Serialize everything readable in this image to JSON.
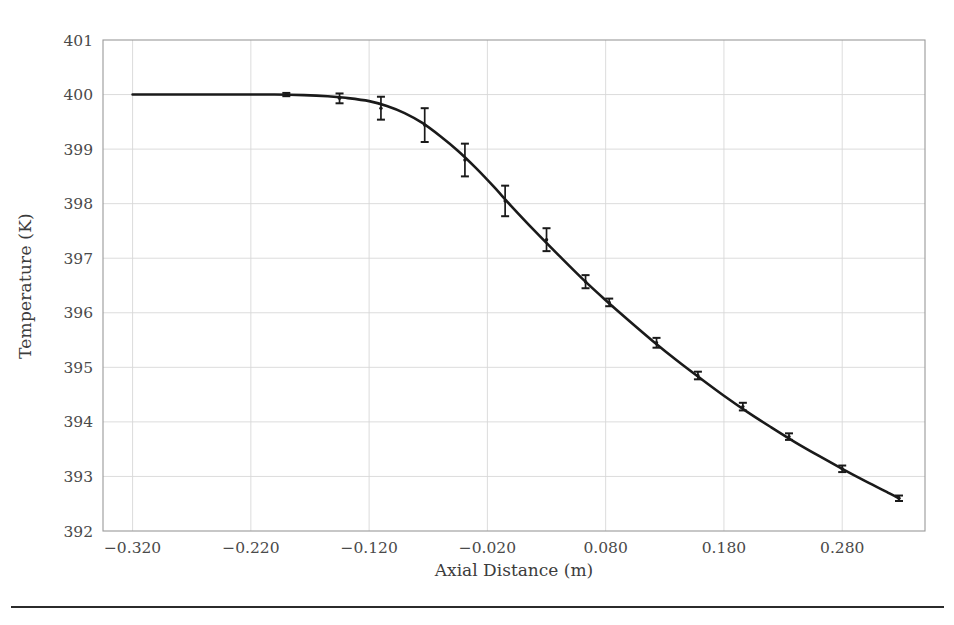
{
  "figure": {
    "background_color": "#ffffff",
    "has_bottom_rule": true
  },
  "axes": {
    "xlabel": "Axial Distance (m)",
    "ylabel": "Temperature (K)",
    "x_ticks": [
      "-0.320",
      "-0.220",
      "-0.120",
      "-0.020",
      "0.080",
      "0.180",
      "0.280"
    ],
    "y_ticks": [
      "392",
      "393",
      "394",
      "395",
      "396",
      "397",
      "398",
      "399",
      "400",
      "401"
    ],
    "grid_color": "#d8d8d8",
    "frame_color": "#9a9a9a",
    "series_color": "#1a1a1a"
  },
  "chart_data": {
    "type": "line",
    "title": "",
    "xlabel": "Axial Distance (m)",
    "ylabel": "Temperature (K)",
    "xlim": [
      -0.345,
      0.35
    ],
    "ylim": [
      392,
      401
    ],
    "xtick_values": [
      -0.32,
      -0.22,
      -0.12,
      -0.02,
      0.08,
      0.18,
      0.28
    ],
    "ytick_values": [
      392,
      393,
      394,
      395,
      396,
      397,
      398,
      399,
      400,
      401
    ],
    "grid": true,
    "legend": "none",
    "series": [
      {
        "name": "Temperature",
        "marker": "point",
        "errorbars": true,
        "x": [
          -0.32,
          -0.25,
          -0.19,
          -0.145,
          -0.12,
          -0.085,
          -0.055,
          -0.028,
          -0.002,
          0.03,
          0.06,
          0.09,
          0.125,
          0.155,
          0.19,
          0.22,
          0.25,
          0.285,
          0.32
        ],
        "y": [
          400.0,
          400.0,
          400.0,
          399.99,
          399.93,
          399.61,
          399.1,
          398.47,
          397.74,
          396.98,
          396.27,
          395.55,
          394.88,
          394.26,
          393.68,
          393.13,
          392.6,
          392.6,
          392.6
        ],
        "yerr": [
          0.02,
          0.03,
          0.04,
          0.05,
          0.09,
          0.19,
          0.3,
          0.28,
          0.2,
          0.12,
          0.08,
          0.06,
          0.05,
          0.05,
          0.04,
          0.04,
          0.04,
          0.04,
          0.04
        ]
      }
    ],
    "curve_points": [
      {
        "x": -0.32,
        "y": 400.0
      },
      {
        "x": -0.28,
        "y": 400.0
      },
      {
        "x": -0.24,
        "y": 400.0
      },
      {
        "x": -0.2,
        "y": 400.0
      },
      {
        "x": -0.175,
        "y": 399.99
      },
      {
        "x": -0.155,
        "y": 399.97
      },
      {
        "x": -0.14,
        "y": 399.94
      },
      {
        "x": -0.12,
        "y": 399.88
      },
      {
        "x": -0.105,
        "y": 399.79
      },
      {
        "x": -0.09,
        "y": 399.66
      },
      {
        "x": -0.075,
        "y": 399.48
      },
      {
        "x": -0.06,
        "y": 399.24
      },
      {
        "x": -0.045,
        "y": 398.97
      },
      {
        "x": -0.03,
        "y": 398.66
      },
      {
        "x": -0.015,
        "y": 398.32
      },
      {
        "x": 0.0,
        "y": 397.96
      },
      {
        "x": 0.02,
        "y": 397.5
      },
      {
        "x": 0.04,
        "y": 397.06
      },
      {
        "x": 0.06,
        "y": 396.63
      },
      {
        "x": 0.08,
        "y": 396.23
      },
      {
        "x": 0.1,
        "y": 395.85
      },
      {
        "x": 0.12,
        "y": 395.48
      },
      {
        "x": 0.14,
        "y": 395.13
      },
      {
        "x": 0.16,
        "y": 394.8
      },
      {
        "x": 0.18,
        "y": 394.48
      },
      {
        "x": 0.2,
        "y": 394.18
      },
      {
        "x": 0.22,
        "y": 393.9
      },
      {
        "x": 0.24,
        "y": 393.63
      },
      {
        "x": 0.26,
        "y": 393.38
      },
      {
        "x": 0.28,
        "y": 393.14
      },
      {
        "x": 0.3,
        "y": 392.91
      },
      {
        "x": 0.32,
        "y": 392.69
      },
      {
        "x": 0.328,
        "y": 392.6
      }
    ],
    "markers": [
      {
        "x": -0.19,
        "y": 400.0,
        "yerr": 0.03
      },
      {
        "x": -0.145,
        "y": 399.93,
        "yerr": 0.09
      },
      {
        "x": -0.11,
        "y": 399.75,
        "yerr": 0.21
      },
      {
        "x": -0.073,
        "y": 399.44,
        "yerr": 0.31
      },
      {
        "x": -0.039,
        "y": 398.8,
        "yerr": 0.3
      },
      {
        "x": -0.005,
        "y": 398.05,
        "yerr": 0.28
      },
      {
        "x": 0.03,
        "y": 397.34,
        "yerr": 0.21
      },
      {
        "x": 0.063,
        "y": 396.57,
        "yerr": 0.12
      },
      {
        "x": 0.083,
        "y": 396.19,
        "yerr": 0.07
      },
      {
        "x": 0.123,
        "y": 395.45,
        "yerr": 0.09
      },
      {
        "x": 0.158,
        "y": 394.85,
        "yerr": 0.07
      },
      {
        "x": 0.196,
        "y": 394.28,
        "yerr": 0.07
      },
      {
        "x": 0.235,
        "y": 393.73,
        "yerr": 0.06
      },
      {
        "x": 0.28,
        "y": 393.14,
        "yerr": 0.06
      },
      {
        "x": 0.328,
        "y": 392.6,
        "yerr": 0.05
      }
    ]
  }
}
